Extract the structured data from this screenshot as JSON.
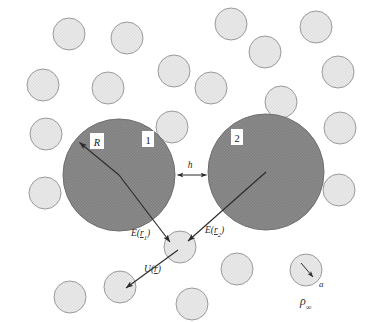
{
  "figure": {
    "background_color": "#ffffff"
  },
  "colors": {
    "large_sphere_fill": "#8d8d8d",
    "large_sphere_texture": "#7c7c7c",
    "large_sphere_stroke": "#6f6f6f",
    "small_circle_fill": "#e9e9e9",
    "small_circle_texture": "#dcdcdc",
    "small_circle_stroke": "#9a9a9a",
    "arrow_color": "#2b2b2b",
    "label_color": "#2b2b2b",
    "label_box_fill": "#ffffff"
  },
  "labels": {
    "radius_R": "R",
    "sphere_one": "1",
    "sphere_two": "2",
    "gap_h": "h",
    "field_r1": "E(r₁)",
    "field_r1_symbol": "E",
    "field_r1_arg": "r",
    "field_r1_sub": "1",
    "field_r2": "E(r₂)",
    "field_r2_symbol": "E",
    "field_r2_arg": "r",
    "field_r2_sub": "2",
    "potential_U": "U(r)",
    "potential_symbol": "U",
    "potential_arg": "r",
    "small_radius_a": "a",
    "number_density": "ρ",
    "number_density_sub": "∞"
  },
  "large_spheres": [
    {
      "name": "sphere-1",
      "label": "1",
      "cx": 119,
      "cy": 175,
      "r": 56,
      "label_x": 148,
      "label_y": 141
    },
    {
      "name": "sphere-2",
      "label": "2",
      "cx": 266,
      "cy": 172,
      "r": 58,
      "label_x": 237,
      "label_y": 139
    }
  ],
  "small_circles": [
    {
      "cx": 69,
      "cy": 34,
      "r": 16
    },
    {
      "cx": 127,
      "cy": 38,
      "r": 16
    },
    {
      "cx": 231,
      "cy": 24,
      "r": 16
    },
    {
      "cx": 316,
      "cy": 27,
      "r": 16
    },
    {
      "cx": 265,
      "cy": 52,
      "r": 16
    },
    {
      "cx": 43,
      "cy": 85,
      "r": 16
    },
    {
      "cx": 108,
      "cy": 88,
      "r": 16
    },
    {
      "cx": 174,
      "cy": 71,
      "r": 16
    },
    {
      "cx": 211,
      "cy": 88,
      "r": 16
    },
    {
      "cx": 281,
      "cy": 102,
      "r": 16
    },
    {
      "cx": 338,
      "cy": 72,
      "r": 16
    },
    {
      "cx": 46,
      "cy": 134,
      "r": 16
    },
    {
      "cx": 172,
      "cy": 127,
      "r": 16
    },
    {
      "cx": 340,
      "cy": 128,
      "r": 16
    },
    {
      "cx": 45,
      "cy": 193,
      "r": 16
    },
    {
      "cx": 339,
      "cy": 190,
      "r": 16
    },
    {
      "cx": 180,
      "cy": 247,
      "r": 16
    },
    {
      "cx": 120,
      "cy": 287,
      "r": 16
    },
    {
      "cx": 70,
      "cy": 297,
      "r": 16
    },
    {
      "cx": 192,
      "cy": 304,
      "r": 16
    },
    {
      "cx": 237,
      "cy": 269,
      "r": 16
    },
    {
      "cx": 306,
      "cy": 270,
      "r": 16
    }
  ],
  "arrows": [
    {
      "name": "radius-arrow-R",
      "from": {
        "x": 119,
        "y": 175
      },
      "to": {
        "x": 78,
        "y": 141
      },
      "label": "R"
    },
    {
      "name": "field-vector-r1",
      "from": {
        "x": 119,
        "y": 175
      },
      "to": {
        "x": 172,
        "y": 243
      },
      "label": "E(r₁)"
    },
    {
      "name": "field-vector-r2",
      "from": {
        "x": 266,
        "y": 172
      },
      "to": {
        "x": 186,
        "y": 242
      },
      "label": "E(r₂)"
    },
    {
      "name": "potential-vector-U",
      "from": {
        "x": 176,
        "y": 250
      },
      "to": {
        "x": 125,
        "y": 288
      },
      "label": "U(r)"
    },
    {
      "name": "gap-arrow-h",
      "from": {
        "x": 208,
        "y": 175
      },
      "to": {
        "x": 176,
        "y": 175
      },
      "label": "h"
    },
    {
      "name": "small-radius-arrow-a",
      "from": {
        "x": 302,
        "y": 264
      },
      "to": {
        "x": 314,
        "y": 278
      },
      "label": "a"
    }
  ],
  "annotations": {
    "gap_label_x": 190,
    "gap_label_y": 166,
    "field_r1_x": 131,
    "field_r1_y": 235,
    "field_r2_x": 206,
    "field_r2_y": 232,
    "potential_x": 144,
    "potential_y": 271,
    "small_radius_x": 319,
    "small_radius_y": 286,
    "density_x": 304,
    "density_y": 303
  }
}
